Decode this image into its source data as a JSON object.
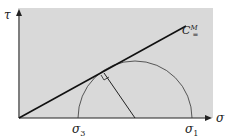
{
  "diagram": {
    "type": "mohr-circle",
    "axes": {
      "x_label": "σ",
      "y_label": "τ"
    },
    "points": {
      "sigma3": {
        "base": "σ",
        "sub": "3"
      },
      "sigma1": {
        "base": "σ",
        "sub": "1"
      }
    },
    "line_label": {
      "base": "C",
      "sup": "M",
      "sub": "="
    },
    "colors": {
      "background": "#d9d9d9",
      "stroke": "#222222"
    }
  }
}
